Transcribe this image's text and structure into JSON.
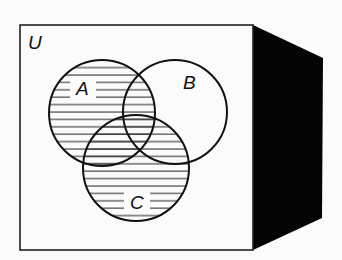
{
  "diagram": {
    "type": "venn",
    "universe_label": "U",
    "sets": [
      {
        "label": "A",
        "shaded": true
      },
      {
        "label": "B",
        "shaded": false
      },
      {
        "label": "C",
        "shaded": true
      }
    ],
    "shaded_region": "A ∪ C",
    "colors": {
      "background": "#fbfbfb",
      "stroke": "#111111",
      "box_side": "#050505"
    }
  }
}
